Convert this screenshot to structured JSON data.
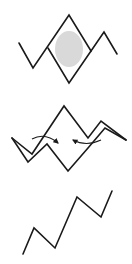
{
  "diagram": {
    "description": "Three stacked line-zigzag figures illustrating fold/merge stages",
    "colors": {
      "stroke": "#1a1a1a",
      "blob_fill": "#d9d9d9",
      "background": "#ffffff"
    },
    "figures": [
      {
        "id": "figure-1",
        "label": "zigzag with enclosed diamond and shaded oval",
        "polyline_outer": [
          [
            19,
            43
          ],
          [
            33,
            68
          ],
          [
            69,
            15
          ],
          [
            91,
            51
          ],
          [
            104,
            32
          ],
          [
            117,
            54
          ]
        ],
        "diamond_lower": [
          [
            48,
            48
          ],
          [
            69,
            83
          ],
          [
            91,
            51
          ]
        ],
        "oval": {
          "cx": 69,
          "cy": 49,
          "rx": 14,
          "ry": 18
        }
      },
      {
        "id": "figure-2",
        "label": "double zigzag with two inward arrows",
        "polyline_upper": [
          [
            12,
            138
          ],
          [
            32,
            154
          ],
          [
            64,
            106
          ],
          [
            88,
            138
          ],
          [
            101,
            121
          ],
          [
            126,
            140
          ]
        ],
        "polyline_lower": [
          [
            12,
            138
          ],
          [
            28,
            162
          ],
          [
            47,
            144
          ],
          [
            68,
            171
          ],
          [
            88,
            148
          ],
          [
            105,
            128
          ],
          [
            126,
            140
          ]
        ],
        "arrows": [
          {
            "from": [
              32,
              139
            ],
            "ctrl": [
              45,
              132
            ],
            "to": [
              58,
              143
            ],
            "direction": "right"
          },
          {
            "from": [
              101,
              140
            ],
            "ctrl": [
              86,
              147
            ],
            "to": [
              73,
              140
            ],
            "direction": "left"
          }
        ]
      },
      {
        "id": "figure-3",
        "label": "single ascending zigzag",
        "polyline": [
          [
            23,
            254
          ],
          [
            34,
            228
          ],
          [
            55,
            248
          ],
          [
            77,
            197
          ],
          [
            101,
            217
          ],
          [
            112,
            191
          ]
        ]
      }
    ]
  }
}
